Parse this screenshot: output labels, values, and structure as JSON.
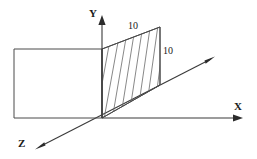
{
  "figure": {
    "background_color": "#ffffff",
    "line_color": "#3a3a3a",
    "hatch_color": "#6a6a6a",
    "text_color": "#1a1a1a",
    "width": 257,
    "height": 159
  },
  "axes": {
    "origin": {
      "x": 102,
      "y": 118
    },
    "y_axis": {
      "label": "Y",
      "label_x": 89,
      "label_y": 17,
      "start": {
        "x": 102,
        "y": 118
      },
      "end": {
        "x": 102,
        "y": 19
      },
      "arrow_tip": {
        "x": 102,
        "y": 16
      }
    },
    "x_axis": {
      "label": "X",
      "label_x": 234,
      "label_y": 110,
      "start": {
        "x": 102,
        "y": 118
      },
      "end": {
        "x": 237,
        "y": 118
      },
      "arrow_tip": {
        "x": 242,
        "y": 118
      }
    },
    "z_axis": {
      "label": "Z",
      "label_x": 18,
      "label_y": 147,
      "start": {
        "x": 211,
        "y": 59
      },
      "end": {
        "x": 41,
        "y": 146
      },
      "arrow_tip_near": {
        "x": 36,
        "y": 149
      },
      "arrow_tip_far": {
        "x": 214,
        "y": 57
      }
    }
  },
  "shapes": {
    "rectangle": {
      "name": "hatched-rectangle-left",
      "points": "14,49 102,49 102,118 14,118",
      "hatch_direction": "lower-left-to-upper-right",
      "hatch_spacing": 13
    },
    "parallelogram": {
      "name": "hatched-parallelogram-right",
      "points": "102,49 160,27 160,85 102,118",
      "hatch_direction": "steep-lower-left-to-upper-right",
      "hatch_count": 7
    }
  },
  "dimensions": [
    {
      "id": "top-edge",
      "value": "10",
      "x": 128,
      "y": 29
    },
    {
      "id": "right-edge",
      "value": "10",
      "x": 163,
      "y": 54
    }
  ]
}
